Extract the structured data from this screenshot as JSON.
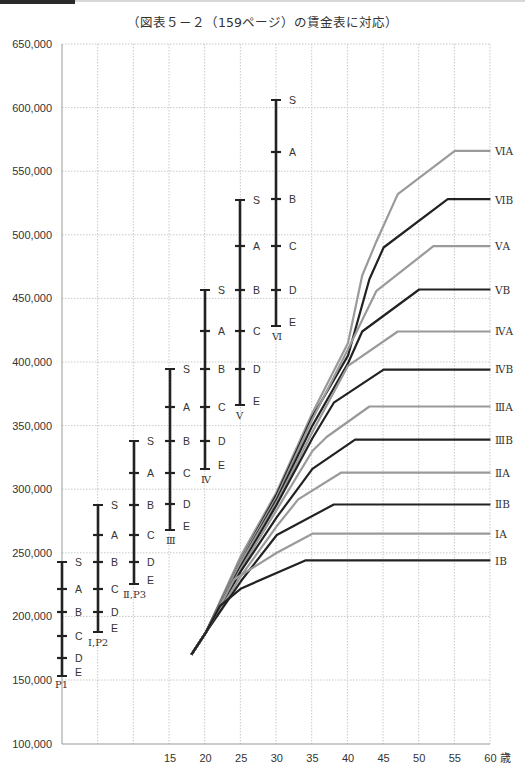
{
  "header": {
    "subtitle": "（図表５－２（159ページ）の賃金表に対応）"
  },
  "axes": {
    "y_ticks": [
      "650,000",
      "600,000",
      "550,000",
      "500,000",
      "450,000",
      "400,000",
      "350,000",
      "300,000",
      "250,000",
      "200,000",
      "150,000",
      "100,000"
    ],
    "x_ticks": [
      "15",
      "20",
      "25",
      "30",
      "35",
      "40",
      "45",
      "50",
      "55",
      "60"
    ],
    "x_unit": "歳"
  },
  "colors": {
    "dark_line": "#222222",
    "light_line": "#9a9a9a",
    "grid": "#c8c8c8",
    "axis": "#999999"
  },
  "chart_data": [
    {
      "type": "range-bars",
      "title": "（図表５－２（159ページ）の賃金表に対応）",
      "ylabel": "",
      "ylim": [
        100000,
        650000
      ],
      "grid": true,
      "series": [
        {
          "name": "P1",
          "ticks": {
            "S": 243000,
            "A": 222000,
            "B": 203000,
            "C": 185000,
            "D": 167000,
            "E": 153000
          }
        },
        {
          "name": "Ⅰ,P2",
          "ticks": {
            "S": 288000,
            "A": 265000,
            "B": 243000,
            "C": 222000,
            "D": 203000,
            "E": 188000
          }
        },
        {
          "name": "Ⅱ,P3",
          "ticks": {
            "S": 339000,
            "A": 313000,
            "B": 288000,
            "C": 265000,
            "D": 243000,
            "E": 225000
          }
        },
        {
          "name": "Ⅲ",
          "ticks": {
            "S": 394000,
            "A": 365000,
            "B": 339000,
            "C": 313000,
            "D": 288000,
            "E": 268000
          }
        },
        {
          "name": "Ⅳ",
          "ticks": {
            "S": 457000,
            "A": 424000,
            "B": 394000,
            "C": 365000,
            "D": 339000,
            "E": 315000
          }
        },
        {
          "name": "Ⅴ",
          "ticks": {
            "S": 528000,
            "A": 491000,
            "B": 457000,
            "C": 424000,
            "D": 394000,
            "E": 366000
          }
        },
        {
          "name": "Ⅵ",
          "ticks": {
            "S": 606000,
            "A": 565000,
            "B": 528000,
            "C": 491000,
            "D": 457000,
            "E": 428000
          }
        }
      ]
    },
    {
      "type": "line",
      "xlabel": "歳",
      "x": [
        18,
        20,
        22,
        25,
        30,
        35,
        40,
        45,
        50,
        55,
        60
      ],
      "xlim": [
        5,
        60
      ],
      "ylim": [
        100000,
        650000
      ],
      "series": [
        {
          "name": "ⅥA",
          "style": "light",
          "points": [
            [
              18,
              170000
            ],
            [
              20,
              187000
            ],
            [
              25,
              248000
            ],
            [
              30,
              298000
            ],
            [
              35,
              360000
            ],
            [
              40,
              415000
            ],
            [
              42,
              468000
            ],
            [
              44,
              495000
            ],
            [
              47,
              532000
            ],
            [
              55,
              566000
            ],
            [
              60,
              566000
            ]
          ]
        },
        {
          "name": "ⅥB",
          "style": "dark",
          "points": [
            [
              18,
              170000
            ],
            [
              20,
              187000
            ],
            [
              25,
              245000
            ],
            [
              30,
              296000
            ],
            [
              35,
              357000
            ],
            [
              40,
              405000
            ],
            [
              43,
              465000
            ],
            [
              45,
              490000
            ],
            [
              54,
              528000
            ],
            [
              60,
              528000
            ]
          ]
        },
        {
          "name": "ⅤA",
          "style": "light",
          "points": [
            [
              18,
              170000
            ],
            [
              20,
              187000
            ],
            [
              25,
              245000
            ],
            [
              30,
              294000
            ],
            [
              35,
              355000
            ],
            [
              40,
              410000
            ],
            [
              44,
              456000
            ],
            [
              52,
              491000
            ],
            [
              60,
              491000
            ]
          ]
        },
        {
          "name": "ⅤB",
          "style": "dark",
          "points": [
            [
              18,
              170000
            ],
            [
              20,
              187000
            ],
            [
              25,
              243000
            ],
            [
              30,
              292000
            ],
            [
              35,
              350000
            ],
            [
              40,
              399000
            ],
            [
              42,
              424000
            ],
            [
              50,
              457000
            ],
            [
              60,
              457000
            ]
          ]
        },
        {
          "name": "ⅣA",
          "style": "light",
          "points": [
            [
              18,
              170000
            ],
            [
              20,
              187000
            ],
            [
              25,
              243000
            ],
            [
              30,
              290000
            ],
            [
              35,
              345000
            ],
            [
              40,
              397000
            ],
            [
              47,
              424000
            ],
            [
              60,
              424000
            ]
          ]
        },
        {
          "name": "ⅣB",
          "style": "dark",
          "points": [
            [
              18,
              170000
            ],
            [
              20,
              187000
            ],
            [
              25,
              240000
            ],
            [
              30,
              288000
            ],
            [
              35,
              340000
            ],
            [
              38,
              368000
            ],
            [
              45,
              394000
            ],
            [
              60,
              394000
            ]
          ]
        },
        {
          "name": "ⅢA",
          "style": "light",
          "points": [
            [
              18,
              170000
            ],
            [
              20,
              187000
            ],
            [
              25,
              238000
            ],
            [
              30,
              284000
            ],
            [
              35,
              330000
            ],
            [
              37,
              341000
            ],
            [
              43,
              365000
            ],
            [
              60,
              365000
            ]
          ]
        },
        {
          "name": "ⅢB",
          "style": "dark",
          "points": [
            [
              18,
              170000
            ],
            [
              20,
              187000
            ],
            [
              25,
              236000
            ],
            [
              30,
              278000
            ],
            [
              35,
              316000
            ],
            [
              41,
              339000
            ],
            [
              60,
              339000
            ]
          ]
        },
        {
          "name": "ⅡA",
          "style": "light",
          "points": [
            [
              18,
              170000
            ],
            [
              20,
              187000
            ],
            [
              25,
              232000
            ],
            [
              30,
              271000
            ],
            [
              33,
              292000
            ],
            [
              39,
              313000
            ],
            [
              60,
              313000
            ]
          ]
        },
        {
          "name": "ⅡB",
          "style": "dark",
          "points": [
            [
              18,
              170000
            ],
            [
              20,
              187000
            ],
            [
              25,
              228000
            ],
            [
              30,
              264000
            ],
            [
              38,
              288000
            ],
            [
              60,
              288000
            ]
          ]
        },
        {
          "name": "ⅠA",
          "style": "light",
          "points": [
            [
              18,
              170000
            ],
            [
              20,
              187000
            ],
            [
              24,
              229000
            ],
            [
              30,
              250000
            ],
            [
              35,
              265000
            ],
            [
              60,
              265000
            ]
          ]
        },
        {
          "name": "ⅠB",
          "style": "dark",
          "points": [
            [
              18,
              170000
            ],
            [
              20,
              187000
            ],
            [
              22,
              208000
            ],
            [
              25,
              222000
            ],
            [
              34,
              244000
            ],
            [
              60,
              244000
            ]
          ]
        }
      ]
    }
  ],
  "bars": [
    {
      "label": "P1",
      "x": 62,
      "ticks": [
        [
          "S",
          562
        ],
        [
          "A",
          589
        ],
        [
          "B",
          612
        ],
        [
          "C",
          636
        ],
        [
          "D",
          658
        ],
        [
          "E",
          676
        ]
      ],
      "lx": 55,
      "ly": 688
    },
    {
      "label": "Ⅰ,P2",
      "x": 98,
      "ticks": [
        [
          "S",
          505
        ],
        [
          "A",
          535
        ],
        [
          "B",
          562
        ],
        [
          "C",
          589
        ],
        [
          "D",
          612
        ],
        [
          "E",
          632
        ]
      ],
      "lx": 88,
      "ly": 646
    },
    {
      "label": "Ⅱ,P3",
      "x": 134,
      "ticks": [
        [
          "S",
          441
        ],
        [
          "A",
          473
        ],
        [
          "B",
          505
        ],
        [
          "C",
          535
        ],
        [
          "D",
          562
        ],
        [
          "E",
          584
        ]
      ],
      "lx": 123,
      "ly": 598
    },
    {
      "label": "Ⅲ",
      "x": 170,
      "ticks": [
        [
          "S",
          369
        ],
        [
          "A",
          407
        ],
        [
          "B",
          441
        ],
        [
          "C",
          473
        ],
        [
          "D",
          504
        ],
        [
          "E",
          530
        ]
      ],
      "lx": 166,
      "ly": 544
    },
    {
      "label": "Ⅳ",
      "x": 205,
      "ticks": [
        [
          "S",
          290
        ],
        [
          "A",
          331
        ],
        [
          "B",
          369
        ],
        [
          "C",
          407
        ],
        [
          "D",
          441
        ],
        [
          "E",
          469
        ]
      ],
      "lx": 201,
      "ly": 483
    },
    {
      "label": "Ⅴ",
      "x": 240,
      "ticks": [
        [
          "S",
          200
        ],
        [
          "A",
          246
        ],
        [
          "B",
          290
        ],
        [
          "C",
          331
        ],
        [
          "D",
          369
        ],
        [
          "E",
          405
        ]
      ],
      "lx": 236,
      "ly": 419
    },
    {
      "label": "Ⅵ",
      "x": 276,
      "ticks": [
        [
          "S",
          100
        ],
        [
          "A",
          152
        ],
        [
          "B",
          199
        ],
        [
          "C",
          246
        ],
        [
          "D",
          290
        ],
        [
          "E",
          326
        ]
      ],
      "lx": 272,
      "ly": 340
    }
  ],
  "right_labels": [
    {
      "text": "ⅥA",
      "y": 151
    },
    {
      "text": "ⅥB",
      "y": 200
    },
    {
      "text": "ⅤA",
      "y": 246
    },
    {
      "text": "ⅤB",
      "y": 290
    },
    {
      "text": "ⅣA",
      "y": 331
    },
    {
      "text": "ⅣB",
      "y": 369
    },
    {
      "text": "ⅢA",
      "y": 407
    },
    {
      "text": "ⅢB",
      "y": 440
    },
    {
      "text": "ⅡA",
      "y": 473
    },
    {
      "text": "ⅡB",
      "y": 504
    },
    {
      "text": "ⅠA",
      "y": 534
    },
    {
      "text": "ⅠB",
      "y": 561
    }
  ]
}
